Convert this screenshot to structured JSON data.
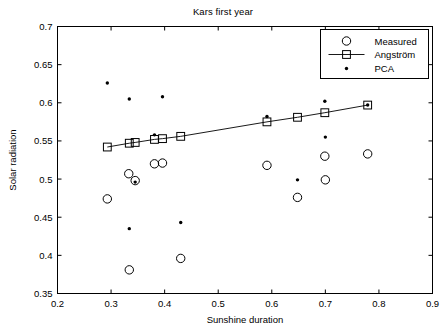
{
  "chart_data": {
    "type": "scatter",
    "title": "Kars first year",
    "xlabel": "Sunshine duration",
    "ylabel": "Solar radiation",
    "xlim": [
      0.2,
      0.9
    ],
    "ylim": [
      0.35,
      0.7
    ],
    "xticks": [
      0.2,
      0.3,
      0.4,
      0.5,
      0.6,
      0.7,
      0.8,
      0.9
    ],
    "xtick_labels": [
      "0.2",
      "0.3",
      "0.4",
      "0.5",
      "0.6",
      "0.7",
      "0.8",
      "0.9"
    ],
    "yticks": [
      0.35,
      0.4,
      0.45,
      0.5,
      0.55,
      0.6,
      0.65,
      0.7
    ],
    "ytick_labels": [
      "0.35",
      "0.4",
      "0.45",
      "0.5",
      "0.55",
      "0.6",
      "0.65",
      "0.7"
    ],
    "grid": false,
    "legend_position": "top-right",
    "series": [
      {
        "name": "Measured",
        "marker": "open-circle",
        "line": false,
        "points": [
          [
            0.293,
            0.474
          ],
          [
            0.333,
            0.507
          ],
          [
            0.345,
            0.498
          ],
          [
            0.334,
            0.381
          ],
          [
            0.381,
            0.52
          ],
          [
            0.396,
            0.521
          ],
          [
            0.43,
            0.396
          ],
          [
            0.591,
            0.518
          ],
          [
            0.648,
            0.476
          ],
          [
            0.699,
            0.53
          ],
          [
            0.7,
            0.499
          ],
          [
            0.779,
            0.533
          ]
        ]
      },
      {
        "name": "Angström",
        "marker": "open-square",
        "line": true,
        "points": [
          [
            0.293,
            0.542
          ],
          [
            0.334,
            0.547
          ],
          [
            0.345,
            0.548
          ],
          [
            0.381,
            0.552
          ],
          [
            0.396,
            0.553
          ],
          [
            0.43,
            0.556
          ],
          [
            0.591,
            0.575
          ],
          [
            0.648,
            0.581
          ],
          [
            0.699,
            0.587
          ],
          [
            0.779,
            0.597
          ]
        ]
      },
      {
        "name": "PCA",
        "marker": "dot",
        "line": false,
        "points": [
          [
            0.293,
            0.626
          ],
          [
            0.334,
            0.605
          ],
          [
            0.396,
            0.608
          ],
          [
            0.345,
            0.496
          ],
          [
            0.334,
            0.435
          ],
          [
            0.43,
            0.443
          ],
          [
            0.381,
            0.558
          ],
          [
            0.591,
            0.582
          ],
          [
            0.648,
            0.499
          ],
          [
            0.699,
            0.602
          ],
          [
            0.7,
            0.555
          ],
          [
            0.779,
            0.597
          ]
        ]
      }
    ]
  }
}
